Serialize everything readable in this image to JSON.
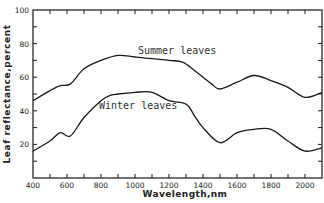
{
  "chart_data": {
    "type": "line",
    "title": "",
    "xlabel": "Wavelength,nm",
    "ylabel": "Leaf reflectance,percent",
    "xlim": [
      400,
      2100
    ],
    "ylim": [
      0,
      100
    ],
    "x_ticks": [
      400,
      600,
      800,
      1000,
      1200,
      1400,
      1600,
      1800,
      2000
    ],
    "y_ticks": [
      20,
      40,
      60,
      80,
      100
    ],
    "grid": false,
    "legend": "inline labels",
    "series": [
      {
        "name": "Summer leaves",
        "x": [
          400,
          500,
          560,
          620,
          700,
          800,
          900,
          1000,
          1100,
          1200,
          1280,
          1350,
          1400,
          1450,
          1500,
          1600,
          1700,
          1800,
          1900,
          2000,
          2100
        ],
        "values": [
          46,
          52,
          55,
          56,
          65,
          70,
          73,
          72,
          71,
          70,
          69,
          64,
          60,
          56,
          53,
          57,
          61,
          58,
          54,
          48,
          51
        ]
      },
      {
        "name": "Winter leaves",
        "x": [
          400,
          500,
          560,
          620,
          700,
          800,
          850,
          900,
          1000,
          1100,
          1200,
          1300,
          1350,
          1400,
          1500,
          1600,
          1700,
          1800,
          1900,
          2000,
          2100
        ],
        "values": [
          16,
          22,
          27,
          25,
          36,
          46,
          49,
          50,
          51,
          51,
          46,
          44,
          37,
          30,
          21,
          27,
          29,
          29,
          22,
          16,
          18
        ]
      }
    ],
    "annotations": [
      {
        "text": "Summer leaves",
        "x": 1150,
        "y": 76
      },
      {
        "text": "Winter leaves",
        "x": 1000,
        "y": 44
      }
    ]
  },
  "labels": {
    "xlabel": "Wavelength,nm",
    "ylabel": "Leaf reflectance,percent",
    "summer": "Summer leaves",
    "winter": "Winter leaves"
  },
  "colors": {
    "line": "#1a1a1a",
    "axis": "#1a1a1a",
    "text": "#222222",
    "background": "#ffffff"
  }
}
